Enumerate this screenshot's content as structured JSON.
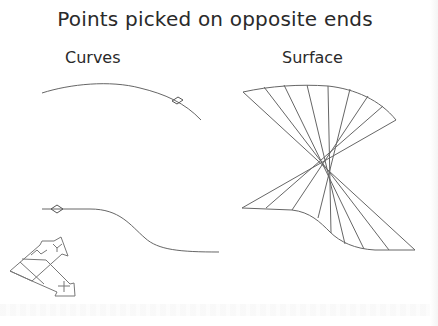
{
  "title": "Points picked on opposite ends",
  "panels": {
    "curves": {
      "label": "Curves"
    },
    "surface": {
      "label": "Surface"
    }
  },
  "triad": {
    "axes": [
      "X",
      "Y",
      "Z"
    ]
  },
  "colors": {
    "line": "#555555",
    "text": "#2a2a2a",
    "background": "#ffffff"
  }
}
